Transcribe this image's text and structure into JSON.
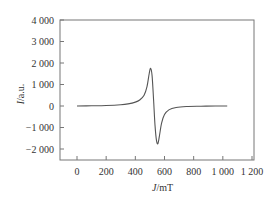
{
  "chart_data": {
    "type": "line",
    "title": "",
    "xlabel": "J/mT",
    "ylabel": "I/a.u.",
    "xlim": [
      -100,
      1200
    ],
    "ylim": [
      -2500,
      4000
    ],
    "xticks": [
      0,
      200,
      400,
      600,
      800,
      1000,
      1200
    ],
    "xtick_labels": [
      "0",
      "200",
      "400",
      "600",
      "800",
      "1 000",
      "1 200"
    ],
    "yticks": [
      -2000,
      -1000,
      0,
      1000,
      2000,
      3000,
      4000
    ],
    "ytick_labels": [
      "−2 000",
      "−1 000",
      "0",
      "1 000",
      "2 000",
      "3 000",
      "4 000"
    ],
    "grid": false,
    "legend": null,
    "series": [
      {
        "name": "EPR signal",
        "x": [
          0,
          100,
          200,
          300,
          350,
          400,
          430,
          460,
          480,
          495,
          505,
          515,
          525,
          535,
          545,
          555,
          565,
          580,
          600,
          630,
          680,
          750,
          850,
          950,
          1030
        ],
        "y": [
          0,
          10,
          25,
          60,
          100,
          180,
          280,
          500,
          900,
          1500,
          1750,
          1400,
          300,
          -900,
          -1600,
          -1750,
          -1400,
          -800,
          -400,
          -180,
          -70,
          -25,
          -10,
          0,
          0
        ]
      }
    ]
  }
}
